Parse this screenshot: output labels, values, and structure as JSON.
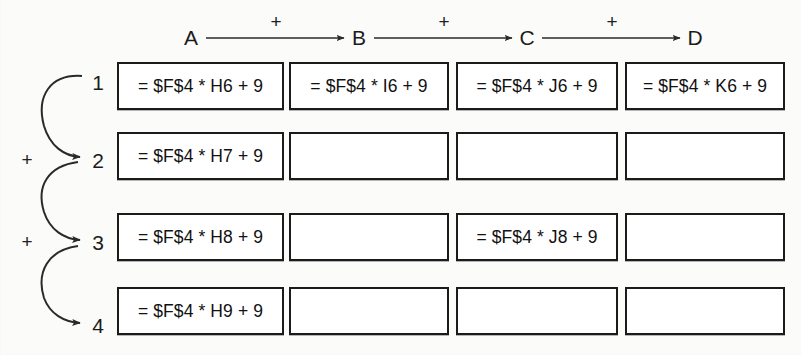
{
  "diagram": {
    "columns": [
      {
        "label": "A",
        "plus_after": "+"
      },
      {
        "label": "B",
        "plus_after": "+"
      },
      {
        "label": "C",
        "plus_after": "+"
      },
      {
        "label": "D",
        "plus_after": ""
      }
    ],
    "rows": [
      {
        "label": "1",
        "plus_below": "+"
      },
      {
        "label": "2",
        "plus_below": "+"
      },
      {
        "label": "3",
        "plus_below": ""
      },
      {
        "label": "4",
        "plus_below": ""
      }
    ],
    "row_plus_labels": [
      "+",
      "+"
    ],
    "cells": [
      [
        "= $F$4 * H6 + 9",
        "= $F$4 * I6 + 9",
        "= $F$4 * J6 + 9",
        "= $F$4 * K6 + 9"
      ],
      [
        "= $F$4 * H7 + 9",
        "",
        "",
        ""
      ],
      [
        "= $F$4 * H8 + 9",
        "",
        "= $F$4 * J8 + 9",
        ""
      ],
      [
        "= $F$4 * H9 + 9",
        "",
        "",
        ""
      ]
    ],
    "colors": {
      "cell_border": "#1b1b1b",
      "cell_fill": "#ffffff",
      "text": "#111111",
      "arrow": "#2a2a2a",
      "page_background": "#fbfbfa"
    }
  }
}
